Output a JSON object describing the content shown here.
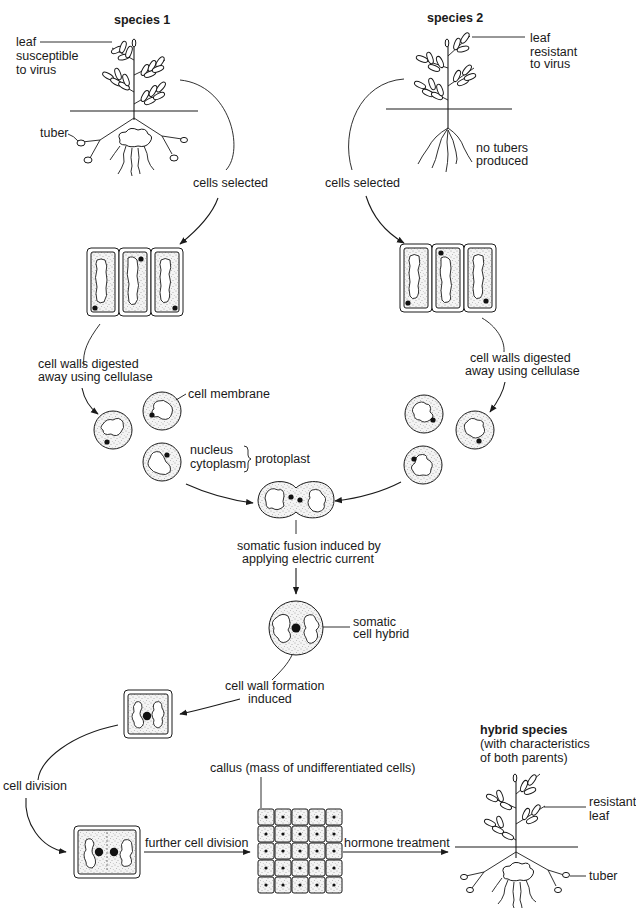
{
  "species1": {
    "heading": "species 1",
    "leaf_label": [
      "leaf",
      "susceptible",
      "to virus"
    ],
    "tuber_label": "tuber",
    "arrow_label": "cells selected"
  },
  "species2": {
    "heading": "species 2",
    "leaf_label": [
      "leaf",
      "resistant",
      "to virus"
    ],
    "roots_label": [
      "no tubers",
      "produced"
    ],
    "arrow_label": "cells selected"
  },
  "digestion": {
    "left_label": [
      "cell walls digested",
      "away using cellulase"
    ],
    "right_label": [
      "cell walls digested",
      "away using cellulase"
    ]
  },
  "protoplast_labels": {
    "cell_membrane": "cell membrane",
    "nucleus": "nucleus",
    "cytoplasm": "cytoplasm",
    "protoplast": "protoplast"
  },
  "fusion": {
    "label": [
      "somatic fusion induced by",
      "applying electric current"
    ]
  },
  "hybrid_cell": {
    "label": [
      "somatic",
      "cell hybrid"
    ]
  },
  "wall_formation": {
    "label": [
      "cell wall formation",
      "induced"
    ]
  },
  "division": {
    "cell_division_label": "cell division",
    "further_label": "further cell division"
  },
  "callus": {
    "label": "callus (mass of undifferentiated cells)",
    "rows": 5,
    "cols": 5
  },
  "hormone": {
    "label": "hormone treatment"
  },
  "hybrid_species": {
    "heading": "hybrid species",
    "subheading": [
      "(with characteristics",
      "of both parents)"
    ],
    "leaf_label": [
      "resistant",
      "leaf"
    ],
    "tuber_label": "tuber"
  }
}
